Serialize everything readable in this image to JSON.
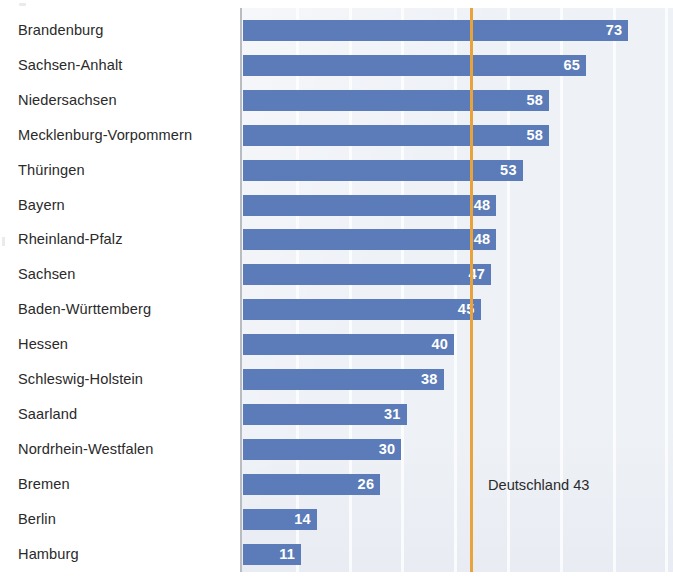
{
  "chart_data": {
    "type": "bar",
    "orientation": "horizontal",
    "title": "",
    "subtitle": "",
    "xlabel": "",
    "ylabel": "",
    "xlim": [
      0,
      82
    ],
    "grid": true,
    "gridlines": [
      10,
      20,
      30,
      40,
      50,
      60,
      70,
      80
    ],
    "legend": "none",
    "categories": [
      "Brandenburg",
      "Sachsen-Anhalt",
      "Niedersachsen",
      "Mecklenburg-Vorpommern",
      "Thüringen",
      "Bayern",
      "Rheinland-Pfalz",
      "Sachsen",
      "Baden-Württemberg",
      "Hessen",
      "Schleswig-Holstein",
      "Saarland",
      "Nordrhein-Westfalen",
      "Bremen",
      "Berlin",
      "Hamburg"
    ],
    "values": [
      73,
      65,
      58,
      58,
      53,
      48,
      48,
      47,
      45,
      40,
      38,
      31,
      30,
      26,
      14,
      11
    ],
    "value_labels": [
      "73",
      "65",
      "58",
      "58",
      "53",
      "48",
      "48",
      "47",
      "45",
      "40",
      "38",
      "31",
      "30",
      "26",
      "14",
      "11"
    ],
    "bar_color": "#5b7cb8",
    "value_label_color": "#ffffff",
    "plot_background": "#eef1f6",
    "axis_color": "#b9bcc0",
    "reference_line": {
      "label": "Deutschland 43",
      "value": 43,
      "color": "#e8a33d"
    },
    "annotations": [
      {
        "text": "Deutschland 43",
        "value": 43
      }
    ]
  },
  "chart": {
    "reference_label": "Deutschland 43"
  }
}
